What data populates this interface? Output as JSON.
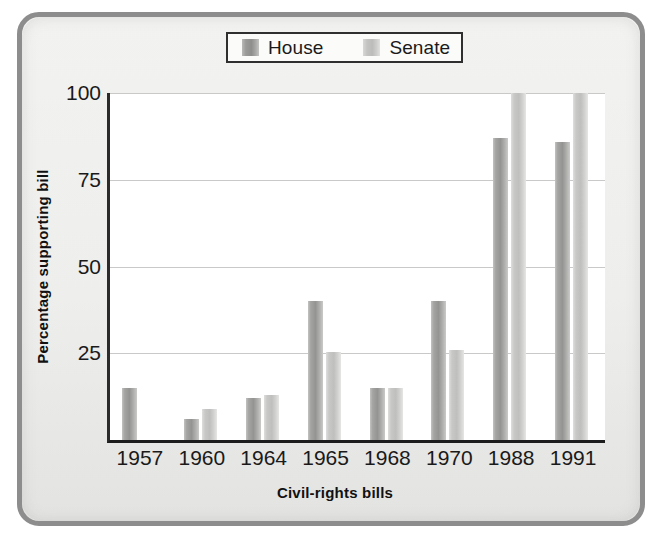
{
  "chart_data": {
    "type": "bar",
    "title": "",
    "xlabel": "Civil-rights bills",
    "ylabel": "Percentage supporting bill",
    "categories": [
      "1957",
      "1960",
      "1964",
      "1965",
      "1968",
      "1970",
      "1988",
      "1991"
    ],
    "series": [
      {
        "name": "House",
        "color": "#9a9a98",
        "values": [
          15,
          6,
          12,
          40,
          15,
          40,
          87,
          86
        ]
      },
      {
        "name": "Senate",
        "color": "#c6c6c4",
        "values": [
          null,
          9,
          13,
          25.5,
          15,
          26,
          100,
          100
        ]
      }
    ],
    "ylim": [
      0,
      100
    ],
    "yticks": [
      25,
      50,
      75,
      100
    ],
    "ytick_labels": [
      "25",
      "50",
      "75",
      "100"
    ],
    "grid": true,
    "legend_position": "top-center"
  },
  "legend": {
    "entries": [
      {
        "label": "House",
        "swatch": "house-swatch"
      },
      {
        "label": "Senate",
        "swatch": "senate-swatch"
      }
    ]
  },
  "axis": {
    "y_title": "Percentage supporting bill",
    "x_title": "Civil-rights bills"
  },
  "colors": {
    "frame_border": "#8d8d8d",
    "frame_background": "#eeeeec",
    "plot_background": "#ffffff",
    "axis_line": "#1d1d1d",
    "gridline": "#c9c9c7",
    "house_bar": "#9a9a98",
    "senate_bar": "#c6c6c4",
    "text": "#1a1a1a"
  }
}
